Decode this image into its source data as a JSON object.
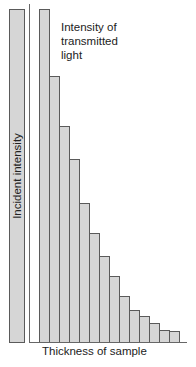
{
  "labels": {
    "transmitted": "Intensity of\ntransmitted\nlight",
    "incident": "Incident intensity",
    "x_axis": "Thickness of sample"
  },
  "colors": {
    "bar_fill": "#d6d6d6",
    "bar_outline": "#5a5a5a",
    "axis": "#666666"
  },
  "chart_data": {
    "type": "bar",
    "title": "",
    "xlabel": "Thickness of sample",
    "ylabel": "Incident intensity",
    "annotation": "Intensity of transmitted light",
    "incident_bar": {
      "label": "Incident intensity",
      "value": 100
    },
    "series": [
      {
        "name": "Intensity of transmitted light",
        "values": [
          100,
          80,
          65,
          55,
          42,
          33,
          26,
          20,
          14,
          10,
          8,
          6,
          4,
          3.5
        ]
      }
    ],
    "categories": [
      "1",
      "2",
      "3",
      "4",
      "5",
      "6",
      "7",
      "8",
      "9",
      "10",
      "11",
      "12",
      "13",
      "14"
    ],
    "grid": false,
    "legend": "none"
  }
}
